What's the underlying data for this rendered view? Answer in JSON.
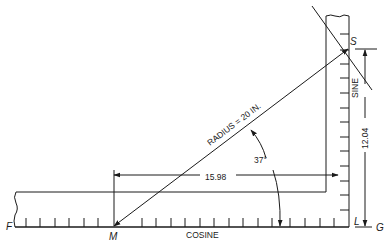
{
  "diagram": {
    "type": "sine-square trigonometry illustration",
    "points": {
      "F": "F",
      "M": "M",
      "S": "S",
      "L": "L",
      "G": "G"
    },
    "labels": {
      "radius": "RADIUS = 20 IN.",
      "angle": "37°",
      "cosine_value": "15.98",
      "sine_value": "12.04",
      "sine_axis": "SINE",
      "cosine_axis": "COSINE"
    }
  }
}
